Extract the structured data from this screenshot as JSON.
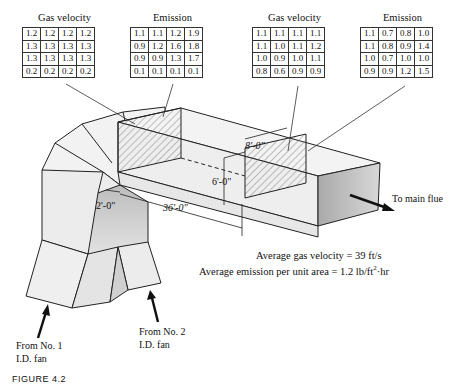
{
  "tables": [
    {
      "title": "Gas velocity",
      "rows": [
        [
          "1.2",
          "1.2",
          "1.2",
          "1.2"
        ],
        [
          "1.3",
          "1.3",
          "1.3",
          "1.3"
        ],
        [
          "1.3",
          "1.3",
          "1.3",
          "1.3"
        ],
        [
          "0.2",
          "0.2",
          "0.2",
          "0.2"
        ]
      ]
    },
    {
      "title": "Emission",
      "rows": [
        [
          "1.1",
          "1.1",
          "1.2",
          "1.9"
        ],
        [
          "0.9",
          "1.2",
          "1.6",
          "1.8"
        ],
        [
          "0.9",
          "0.9",
          "1.3",
          "1.7"
        ],
        [
          "0.1",
          "0.1",
          "0.1",
          "0.1"
        ]
      ]
    },
    {
      "title": "Gas velocity",
      "rows": [
        [
          "1.1",
          "1.1",
          "1.1",
          "1.1"
        ],
        [
          "1.1",
          "1.0",
          "1.1",
          "1.2"
        ],
        [
          "1.0",
          "0.9",
          "1.0",
          "1.1"
        ],
        [
          "0.8",
          "0.6",
          "0.9",
          "0.9"
        ]
      ]
    },
    {
      "title": "Emission",
      "rows": [
        [
          "1.1",
          "0.7",
          "0.8",
          "1.0"
        ],
        [
          "1.1",
          "0.8",
          "0.9",
          "1.4"
        ],
        [
          "1.0",
          "0.7",
          "1.0",
          "1.0"
        ],
        [
          "0.9",
          "0.9",
          "1.2",
          "1.5"
        ]
      ]
    }
  ],
  "dimensions": {
    "width": "8'-0\"",
    "height": "6'-0\"",
    "offset": "2'-0\"",
    "length": "36'-0\""
  },
  "labels": {
    "outlet": "To main flue",
    "fan1_line1": "From No. 1",
    "fan1_line2": "I.D. fan",
    "fan2_line1": "From No. 2",
    "fan2_line2": "I.D. fan"
  },
  "averages": {
    "velocity": "Average gas velocity = 39 ft/s",
    "emission_prefix": "Average emission per unit area = 1.2 lb/ft",
    "emission_sup": "2",
    "emission_suffix": "·hr"
  },
  "caption": "FIGURE 4.2"
}
